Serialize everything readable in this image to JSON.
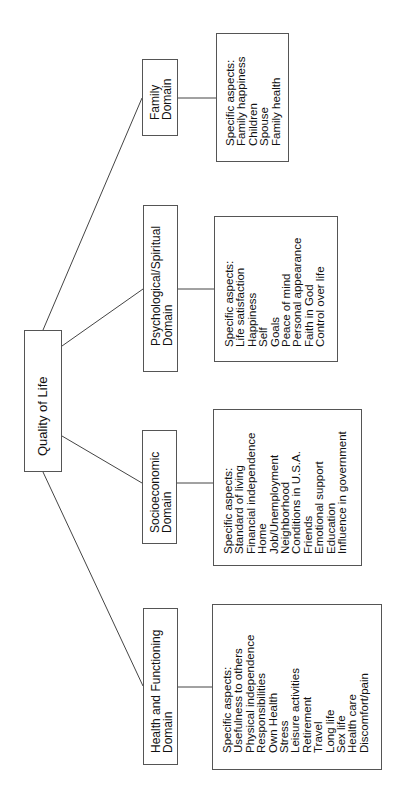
{
  "diagram": {
    "root": {
      "label": "Quality of Life"
    },
    "domains": [
      {
        "id": "family",
        "title_lines": [
          "Family",
          "Domain"
        ],
        "aspects_header": "Specific aspects:",
        "aspects": [
          "Family happiness",
          "Children",
          "Spouse",
          "Family health"
        ]
      },
      {
        "id": "psychological-spiritual",
        "title_lines": [
          "Psychological/Spiritual",
          "Domain"
        ],
        "aspects_header": "Specific aspects:",
        "aspects": [
          "Life satisfaction",
          "Happiness",
          "Self",
          "Goals",
          "Peace of mind",
          "Personal appearance",
          "Faith in God",
          "Control over life"
        ]
      },
      {
        "id": "socioeconomic",
        "title_lines": [
          "Socioeconomic",
          "Domain"
        ],
        "aspects_header": "Specific aspects:",
        "aspects": [
          "Standard of living",
          "Financial independence",
          "Home",
          "Job/Unemployment",
          "Neighborhood",
          "Conditions in U.S.A.",
          "Friends",
          "Emotional support",
          "Education",
          "Influence in government"
        ]
      },
      {
        "id": "health-functioning",
        "title_lines": [
          "Health and Functioning",
          "Domain"
        ],
        "aspects_header": "Specific aspects:",
        "aspects": [
          "Usefulness to others",
          "Physical independence",
          "Responsibilities",
          "Own Health",
          "Stress",
          "Leisure activities",
          "Retirement",
          "Travel",
          "Long life",
          "Sex life",
          "Health care",
          "Discomfort/pain"
        ]
      }
    ],
    "colors": {
      "line": "#444444",
      "border": "#555555",
      "text": "#111111"
    }
  }
}
